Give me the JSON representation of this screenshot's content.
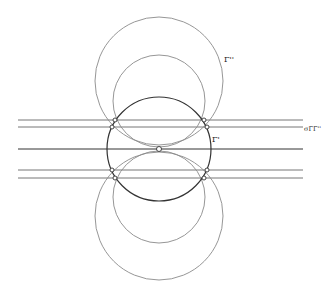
{
  "diagram": {
    "type": "geometric-construction",
    "colors": {
      "background": "#ffffff",
      "stroke_dark": "#333333",
      "stroke_light": "#8a8a8a",
      "point_fill": "#ffffff"
    },
    "labels": {
      "gamma": "Γ'",
      "gamma_double_prime": "Γ''",
      "sigma_label": "σΓΓ''"
    },
    "central_circle": {
      "name": "Γ",
      "cx": 159,
      "cy": 149,
      "r": 52
    },
    "upper_circles": [
      {
        "name": "upper-large",
        "cx": 159,
        "cy": 81,
        "r": 64
      },
      {
        "name": "upper-medium",
        "cx": 159,
        "cy": 101,
        "r": 46
      }
    ],
    "lower_circles": [
      {
        "name": "lower-large",
        "cx": 159,
        "cy": 216,
        "r": 64
      },
      {
        "name": "lower-medium",
        "cx": 159,
        "cy": 197,
        "r": 46
      }
    ],
    "horizontal_lines": [
      {
        "y": 120,
        "x1": 18,
        "x2": 303
      },
      {
        "y": 127,
        "x1": 18,
        "x2": 303
      },
      {
        "y": 149,
        "x1": 18,
        "x2": 303
      },
      {
        "y": 170,
        "x1": 18,
        "x2": 303
      },
      {
        "y": 178,
        "x1": 18,
        "x2": 303
      }
    ],
    "points": [
      {
        "x": 159,
        "y": 149
      },
      {
        "x": 115,
        "y": 120
      },
      {
        "x": 204,
        "y": 120
      },
      {
        "x": 112,
        "y": 127
      },
      {
        "x": 207,
        "y": 127
      },
      {
        "x": 112,
        "y": 170
      },
      {
        "x": 207,
        "y": 170
      },
      {
        "x": 115,
        "y": 178
      },
      {
        "x": 204,
        "y": 178
      }
    ]
  }
}
